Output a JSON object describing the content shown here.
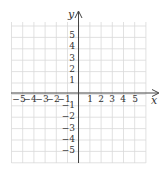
{
  "diagram": {
    "type": "coordinate-plane",
    "x_axis_label": "x",
    "y_axis_label": "y",
    "x_range": [
      -6,
      6
    ],
    "y_range": [
      -6,
      6
    ],
    "x_tick_labels": [
      "-5",
      "-4",
      "-3",
      "-2",
      "-1",
      "1",
      "2",
      "3",
      "4",
      "5"
    ],
    "y_tick_labels": [
      "5",
      "4",
      "3",
      "2",
      "1",
      "-1",
      "-2",
      "-3",
      "-4",
      "-5"
    ],
    "grid": true,
    "colors": {
      "grid": "#d9d9d9",
      "axis": "#444444",
      "text": "#333333"
    }
  }
}
